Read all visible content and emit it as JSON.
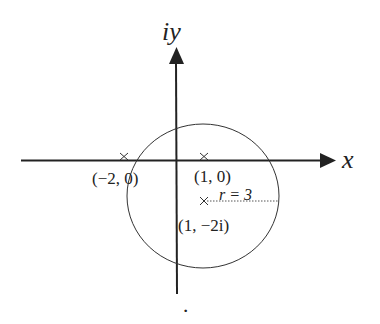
{
  "diagram": {
    "axes": {
      "x_label": "x",
      "y_label": "iy"
    },
    "points": [
      {
        "label": "(−2, 0)",
        "marker": "×"
      },
      {
        "label": "(1, 0)",
        "marker": "×"
      },
      {
        "label": "(1, −2i)",
        "marker": "×"
      }
    ],
    "circle": {
      "center_label": "(1, −2i)",
      "radius_label": "r = 3"
    },
    "footer_mark": "·"
  }
}
